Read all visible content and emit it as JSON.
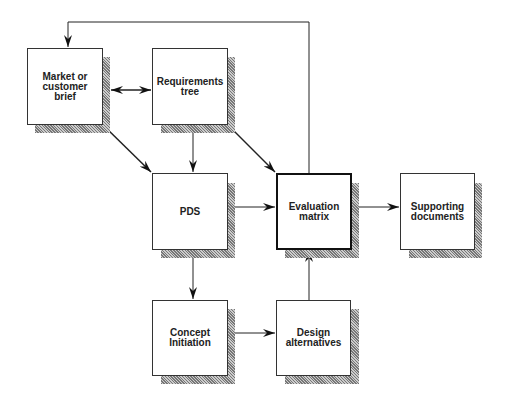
{
  "diagram": {
    "nodes": [
      {
        "id": "market",
        "label": "Market or\ncustomer\nbrief"
      },
      {
        "id": "requirements",
        "label": "Requirements\ntree"
      },
      {
        "id": "pds",
        "label": "PDS"
      },
      {
        "id": "evaluation",
        "label": "Evaluation\nmatrix"
      },
      {
        "id": "supporting",
        "label": "Supporting\ndocuments"
      },
      {
        "id": "concept",
        "label": "Concept\nInitiation"
      },
      {
        "id": "design",
        "label": "Design\nalternatives"
      }
    ],
    "edges": [
      {
        "from": "market",
        "to": "requirements",
        "type": "bidirectional"
      },
      {
        "from": "market",
        "to": "pds"
      },
      {
        "from": "requirements",
        "to": "pds"
      },
      {
        "from": "requirements",
        "to": "evaluation"
      },
      {
        "from": "pds",
        "to": "evaluation"
      },
      {
        "from": "pds",
        "to": "concept"
      },
      {
        "from": "concept",
        "to": "design"
      },
      {
        "from": "design",
        "to": "evaluation"
      },
      {
        "from": "evaluation",
        "to": "supporting"
      },
      {
        "from": "evaluation",
        "to": "market",
        "type": "feedback-loop"
      }
    ]
  }
}
